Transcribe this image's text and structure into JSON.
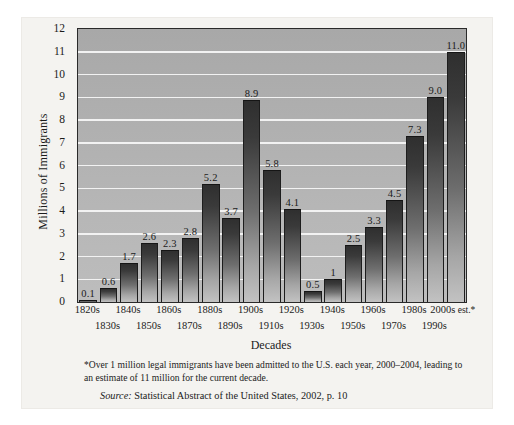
{
  "chart_data": {
    "type": "bar",
    "title": "",
    "xlabel": "Decades",
    "ylabel": "Millions of Immigrants",
    "ylim": [
      0,
      12
    ],
    "ytick_step": 1,
    "yticks": [
      "0",
      "1",
      "2",
      "3",
      "4",
      "5",
      "6",
      "7",
      "8",
      "9",
      "10",
      "11",
      "12"
    ],
    "grid": "horizontal",
    "legend": "none",
    "categories": [
      "1820s",
      "1830s",
      "1840s",
      "1850s",
      "1860s",
      "1870s",
      "1880s",
      "1890s",
      "1900s",
      "1910s",
      "1920s",
      "1930s",
      "1940s",
      "1950s",
      "1960s",
      "1970s",
      "1980s",
      "1990s",
      "2000s"
    ],
    "values": [
      0.1,
      0.6,
      1.7,
      2.6,
      2.3,
      2.8,
      5.2,
      3.7,
      8.9,
      5.8,
      4.1,
      0.5,
      1,
      2.5,
      3.3,
      4.5,
      7.3,
      9.0,
      11.0
    ],
    "value_labels": [
      "0.1",
      "0.6",
      "1.7",
      "2.6",
      "2.3",
      "2.8",
      "5.2",
      "3.7",
      "8.9",
      "5.8",
      "4.1",
      "0.5",
      "1",
      "2.5",
      "3.3",
      "4.5",
      "7.3",
      "9.0",
      "11.0"
    ],
    "last_category_note": "est.*",
    "footnote": "*Over 1 million legal immigrants have been admitted to the U.S. each year, 2000–2004, leading to an estimate of 11 million for the current decade.",
    "source_label": "Source:",
    "source_text": "Statistical Abstract of the United States, 2002, p. 10",
    "colors": {
      "plot_background": "#b0b0b0",
      "gridline": "#f2f2f2",
      "bar_top": "#2f2f2f",
      "bar_bottom": "#c2c2c2",
      "frame": "#2a2a2a",
      "card_background": "#f4f3f0",
      "text": "#1b1b1b"
    }
  }
}
